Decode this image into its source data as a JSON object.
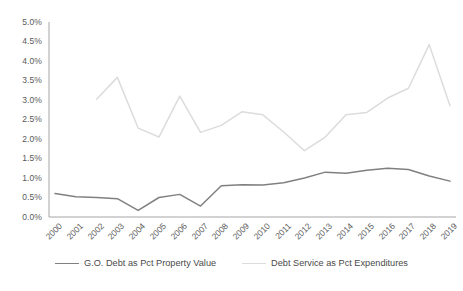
{
  "chart_data": {
    "type": "line",
    "title": "",
    "subtitle": "",
    "xlabel": "",
    "ylabel": "",
    "x": [
      2000,
      2001,
      2002,
      2003,
      2004,
      2005,
      2006,
      2007,
      2008,
      2009,
      2010,
      2011,
      2012,
      2013,
      2014,
      2015,
      2016,
      2017,
      2018,
      2019
    ],
    "categories": [
      "2000",
      "2001",
      "2002",
      "2003",
      "2004",
      "2005",
      "2006",
      "2007",
      "2008",
      "2009",
      "2010",
      "2011",
      "2012",
      "2013",
      "2014",
      "2015",
      "2016",
      "2017",
      "2018",
      "2019"
    ],
    "ylim": [
      0.0,
      5.0
    ],
    "ytick_values": [
      0.0,
      0.5,
      1.0,
      1.5,
      2.0,
      2.5,
      3.0,
      3.5,
      4.0,
      4.5,
      5.0
    ],
    "ytick_labels": [
      "0.0%",
      "0.5%",
      "1.0%",
      "1.5%",
      "2.0%",
      "2.5%",
      "3.0%",
      "3.5%",
      "4.0%",
      "4.5%",
      "5.0%"
    ],
    "grid": false,
    "legend_position": "bottom",
    "series": [
      {
        "name": "G.O. Debt as Pct Property Value",
        "color": "#808080",
        "values": [
          0.6,
          0.52,
          0.5,
          0.47,
          0.17,
          0.5,
          0.58,
          0.28,
          0.8,
          0.83,
          0.82,
          0.88,
          1.0,
          1.15,
          1.12,
          1.2,
          1.25,
          1.22,
          1.05,
          0.92
        ]
      },
      {
        "name": "Debt Service as Pct Expenditures",
        "color": "#dcdcdc",
        "values": [
          null,
          null,
          3.02,
          3.58,
          2.28,
          2.05,
          3.1,
          2.17,
          2.35,
          2.7,
          2.62,
          2.18,
          1.7,
          2.05,
          2.62,
          2.68,
          3.05,
          3.3,
          4.42,
          2.85
        ]
      }
    ]
  },
  "legend": {
    "entries": [
      {
        "label": "G.O. Debt as Pct Property Value",
        "color": "#808080"
      },
      {
        "label": "Debt Service as Pct Expenditures",
        "color": "#dcdcdc"
      }
    ]
  },
  "axes": {
    "axis_color": "#a6a6a6"
  }
}
